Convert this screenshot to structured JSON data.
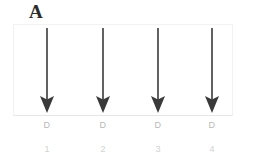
{
  "figure": {
    "panel_letter": "A",
    "background_color": "#ffffff",
    "box_border_color": "#f2f2f2",
    "arrow_color": "#3a3a3a",
    "d_label_color": "#b9b9b9",
    "number_label_color": "#d2d2d2"
  },
  "lanes": [
    {
      "arrow": "down-arrow",
      "d_label": "D",
      "number": "1",
      "x": 35
    },
    {
      "arrow": "down-arrow",
      "d_label": "D",
      "number": "2",
      "x": 91
    },
    {
      "arrow": "down-arrow",
      "d_label": "D",
      "number": "3",
      "x": 146
    },
    {
      "arrow": "down-arrow",
      "d_label": "D",
      "number": "4",
      "x": 200
    }
  ]
}
